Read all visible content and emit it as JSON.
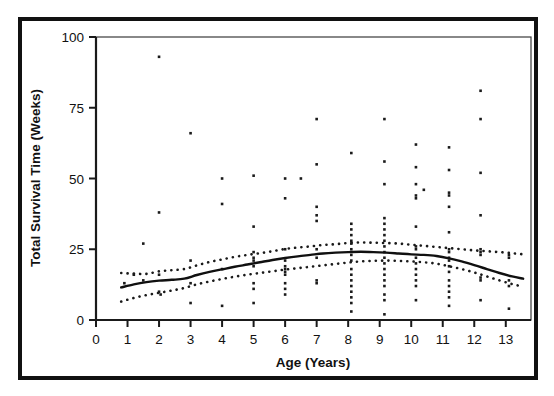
{
  "figure": {
    "border_color": "#111111",
    "background": "#ffffff",
    "ink_color": "#1a1a1a"
  },
  "chart_data": {
    "type": "scatter",
    "title": "",
    "subtitle": "",
    "xlabel": "Age (Years)",
    "ylabel": "Total Survival Time (Weeks)",
    "xlim": [
      0,
      13.8
    ],
    "ylim": [
      0,
      100
    ],
    "xticks": [
      0,
      1,
      2,
      3,
      4,
      5,
      6,
      7,
      8,
      9,
      10,
      11,
      12,
      13
    ],
    "yticks": [
      0,
      25,
      50,
      75,
      100
    ],
    "xtick_labels": [
      "0",
      "1",
      "2",
      "3",
      "4",
      "5",
      "6",
      "7",
      "8",
      "9",
      "10",
      "11",
      "12",
      "13"
    ],
    "ytick_labels": [
      "0",
      "25",
      "50",
      "75",
      "100"
    ],
    "grid": false,
    "legend": "none",
    "annotations": [],
    "points": [
      [
        1.5,
        27
      ],
      [
        1.5,
        14
      ],
      [
        1.2,
        16
      ],
      [
        0.9,
        13
      ],
      [
        2.0,
        93
      ],
      [
        2.0,
        38
      ],
      [
        2.0,
        16
      ],
      [
        2.0,
        10
      ],
      [
        2.05,
        9
      ],
      [
        3.0,
        66
      ],
      [
        3.0,
        21
      ],
      [
        3.0,
        13
      ],
      [
        3.0,
        6
      ],
      [
        4.0,
        50
      ],
      [
        4.0,
        41
      ],
      [
        4.0,
        18
      ],
      [
        4.0,
        5
      ],
      [
        5.0,
        51
      ],
      [
        5.0,
        33
      ],
      [
        5.0,
        24
      ],
      [
        5.0,
        22
      ],
      [
        5.0,
        21
      ],
      [
        5.0,
        19
      ],
      [
        5.0,
        13
      ],
      [
        5.0,
        11
      ],
      [
        5.0,
        6
      ],
      [
        6.0,
        50
      ],
      [
        6.0,
        43
      ],
      [
        6.0,
        25
      ],
      [
        6.0,
        21
      ],
      [
        6.0,
        19
      ],
      [
        6.0,
        18
      ],
      [
        6.0,
        17
      ],
      [
        6.0,
        16
      ],
      [
        6.0,
        13
      ],
      [
        6.0,
        11
      ],
      [
        6.0,
        9
      ],
      [
        6.5,
        50
      ],
      [
        7.0,
        71
      ],
      [
        7.0,
        55
      ],
      [
        7.0,
        40
      ],
      [
        7.0,
        37
      ],
      [
        7.0,
        35
      ],
      [
        7.0,
        25
      ],
      [
        7.0,
        22
      ],
      [
        7.0,
        14
      ],
      [
        7.0,
        13
      ],
      [
        8.1,
        59
      ],
      [
        8.1,
        34
      ],
      [
        8.1,
        32
      ],
      [
        8.1,
        30
      ],
      [
        8.1,
        28
      ],
      [
        8.1,
        27
      ],
      [
        8.1,
        25
      ],
      [
        8.1,
        23
      ],
      [
        8.1,
        21
      ],
      [
        8.1,
        18
      ],
      [
        8.1,
        16
      ],
      [
        8.1,
        14
      ],
      [
        8.1,
        12
      ],
      [
        8.1,
        10
      ],
      [
        8.1,
        8
      ],
      [
        8.1,
        6
      ],
      [
        8.1,
        3
      ],
      [
        9.15,
        71
      ],
      [
        9.15,
        56
      ],
      [
        9.15,
        48
      ],
      [
        9.15,
        36
      ],
      [
        9.15,
        34
      ],
      [
        9.15,
        32
      ],
      [
        9.15,
        30
      ],
      [
        9.15,
        28
      ],
      [
        9.15,
        26
      ],
      [
        9.15,
        24
      ],
      [
        9.15,
        22
      ],
      [
        9.15,
        20
      ],
      [
        9.15,
        18
      ],
      [
        9.15,
        16
      ],
      [
        9.15,
        14
      ],
      [
        9.15,
        12
      ],
      [
        9.15,
        9
      ],
      [
        9.15,
        7
      ],
      [
        9.15,
        2
      ],
      [
        10.15,
        62
      ],
      [
        10.15,
        54
      ],
      [
        10.15,
        48
      ],
      [
        10.15,
        44
      ],
      [
        10.15,
        43
      ],
      [
        10.15,
        33
      ],
      [
        10.15,
        26
      ],
      [
        10.15,
        25
      ],
      [
        10.15,
        22
      ],
      [
        10.15,
        20
      ],
      [
        10.15,
        18
      ],
      [
        10.15,
        16
      ],
      [
        10.15,
        14
      ],
      [
        10.15,
        12
      ],
      [
        10.15,
        7
      ],
      [
        10.4,
        46
      ],
      [
        11.2,
        61
      ],
      [
        11.2,
        53
      ],
      [
        11.2,
        45
      ],
      [
        11.2,
        44
      ],
      [
        11.2,
        40
      ],
      [
        11.2,
        31
      ],
      [
        11.2,
        25
      ],
      [
        11.2,
        24
      ],
      [
        11.2,
        22
      ],
      [
        11.2,
        21
      ],
      [
        11.2,
        19
      ],
      [
        11.2,
        17
      ],
      [
        11.2,
        14
      ],
      [
        11.2,
        12
      ],
      [
        11.2,
        10
      ],
      [
        11.2,
        8
      ],
      [
        11.2,
        5
      ],
      [
        12.2,
        81
      ],
      [
        12.2,
        71
      ],
      [
        12.2,
        52
      ],
      [
        12.2,
        37
      ],
      [
        12.2,
        25
      ],
      [
        12.2,
        24
      ],
      [
        12.2,
        23
      ],
      [
        12.2,
        15
      ],
      [
        12.2,
        14
      ],
      [
        12.2,
        7
      ],
      [
        13.1,
        23
      ],
      [
        13.1,
        22
      ],
      [
        13.1,
        14
      ],
      [
        13.1,
        12
      ],
      [
        13.1,
        4
      ]
    ],
    "series": [
      {
        "name": "smoothed-fit",
        "style": "solid",
        "x": [
          0.8,
          1.2,
          1.6,
          2.0,
          2.4,
          2.8,
          3.2,
          3.6,
          4.0,
          4.4,
          4.8,
          5.2,
          5.6,
          6.0,
          6.4,
          6.8,
          7.2,
          7.6,
          8.0,
          8.4,
          8.8,
          9.2,
          9.6,
          10.0,
          10.4,
          10.8,
          11.2,
          11.6,
          12.0,
          12.4,
          12.8,
          13.2,
          13.55
        ],
        "values": [
          11.5,
          12.6,
          13.4,
          13.9,
          14.2,
          14.6,
          15.9,
          17.0,
          17.9,
          18.8,
          19.6,
          20.4,
          21.2,
          21.9,
          22.5,
          23.0,
          23.5,
          23.8,
          24.0,
          24.1,
          24.0,
          23.8,
          23.5,
          23.2,
          23.0,
          22.6,
          21.8,
          20.7,
          19.4,
          18.0,
          16.6,
          15.4,
          14.6
        ]
      },
      {
        "name": "upper-confidence-band",
        "style": "dotted",
        "x": [
          0.8,
          1.2,
          1.6,
          2.0,
          2.4,
          2.8,
          3.2,
          3.6,
          4.0,
          4.4,
          4.8,
          5.2,
          5.6,
          6.0,
          6.4,
          6.8,
          7.2,
          7.6,
          8.0,
          8.4,
          8.8,
          9.2,
          9.6,
          10.0,
          10.4,
          10.8,
          11.2,
          11.6,
          12.0,
          12.4,
          12.8,
          13.2,
          13.55
        ],
        "values": [
          16.6,
          16.4,
          16.3,
          17.2,
          17.6,
          18.0,
          19.3,
          20.5,
          21.4,
          22.3,
          23.0,
          23.6,
          24.3,
          25.1,
          25.6,
          26.0,
          26.5,
          26.8,
          27.2,
          27.4,
          27.3,
          27.2,
          27.0,
          26.6,
          26.2,
          25.8,
          25.4,
          25.0,
          24.6,
          24.3,
          24.0,
          23.6,
          23.2
        ]
      },
      {
        "name": "lower-confidence-band",
        "style": "dotted",
        "x": [
          0.8,
          1.2,
          1.6,
          2.0,
          2.4,
          2.8,
          3.2,
          3.6,
          4.0,
          4.4,
          4.8,
          5.2,
          5.6,
          6.0,
          6.4,
          6.8,
          7.2,
          7.6,
          8.0,
          8.4,
          8.8,
          9.2,
          9.6,
          10.0,
          10.4,
          10.8,
          11.2,
          11.6,
          12.0,
          12.4,
          12.8,
          13.2,
          13.55
        ],
        "values": [
          6.5,
          7.8,
          8.8,
          9.6,
          10.4,
          11.3,
          12.6,
          13.6,
          14.5,
          15.3,
          16.0,
          16.6,
          17.2,
          17.8,
          18.3,
          18.8,
          19.3,
          19.8,
          20.3,
          20.7,
          20.9,
          21.0,
          20.9,
          20.7,
          20.4,
          19.9,
          19.0,
          18.0,
          16.8,
          15.4,
          14.0,
          12.7,
          11.8
        ]
      }
    ]
  }
}
